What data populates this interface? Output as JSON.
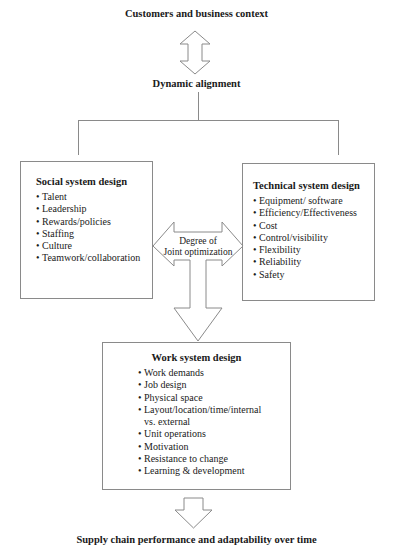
{
  "diagram": {
    "top_label": "Customers and business context",
    "alignment_label": "Dynamic alignment",
    "social_box": {
      "title": "Social system design",
      "items": [
        "Talent",
        "Leadership",
        "Rewards/policies",
        "Staffing",
        "Culture",
        "Teamwork/collaboration"
      ]
    },
    "technical_box": {
      "title": "Technical system design",
      "items": [
        "Equipment/ software",
        "Efficiency/Effectiveness",
        "Cost",
        "Control/visibility",
        "Flexibility",
        "Reliability",
        "Safety"
      ]
    },
    "joint_arrow": {
      "line1": "Degree of",
      "line2": "Joint optimization"
    },
    "work_box": {
      "title": "Work system design",
      "items": [
        "Work demands",
        "Job design",
        "Physical space",
        "Layout/location/time/internal",
        "vs. external",
        "Unit operations",
        "Motivation",
        "Resistance to change",
        "Learning & development"
      ]
    },
    "bottom_label": "Supply chain performance and adaptability over time",
    "bullet": "•",
    "colors": {
      "stroke": "#8a8a8a",
      "text": "#1a1a1a",
      "background": "#ffffff"
    }
  }
}
